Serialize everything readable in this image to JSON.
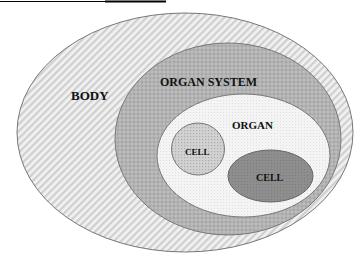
{
  "diagram": {
    "type": "nested-ellipses",
    "colors": {
      "background": "#ffffff",
      "outline": "#777777",
      "body_fill": "#f1f1f1",
      "body_hatch": "#cfcfcf",
      "organ_system_fill": "#bdbdbd",
      "organ_system_pattern": "#a4a4a4",
      "organ_fill": "#f4f4f4",
      "organ_pattern": "#e2e2e2",
      "cell1_fill": "#cfcfcf",
      "cell1_pattern": "#b3b3b3",
      "cell2_fill": "#8c8c8c",
      "cell2_pattern": "#7d7d7d",
      "header_line": "#000000"
    },
    "regions": [
      {
        "id": "body",
        "label": "BODY"
      },
      {
        "id": "organ_system",
        "label": "ORGAN SYSTEM"
      },
      {
        "id": "organ",
        "label": "ORGAN"
      },
      {
        "id": "cell_1",
        "label": "CELL"
      },
      {
        "id": "cell_2",
        "label": "CELL"
      }
    ]
  }
}
